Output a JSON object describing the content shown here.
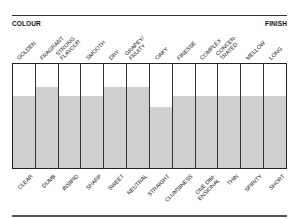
{
  "header": {
    "left_label": "COLOUR",
    "right_label": "FINISH"
  },
  "chart_data": {
    "type": "bar",
    "title": "",
    "xlabel": "",
    "ylabel": "",
    "ylim": [
      0,
      100
    ],
    "grid": false,
    "legend": "none",
    "annotations": [
      "COLOUR",
      "FINISH"
    ],
    "categories_top": [
      "GOLDEN",
      "FRAGRANT",
      "STRONG FLAVOUR",
      "SMOOTH",
      "DRY",
      "GRAPEY/ FRUITY",
      "OAKY",
      "FINESSE",
      "COMPLEX",
      "CONCEN- TRATED",
      "MELLOW",
      "LONG"
    ],
    "categories_bottom": [
      "CLEAR",
      "DUMB",
      "INSIPID",
      "SHARP",
      "SWEET",
      "NEUTRAL",
      "STRAIGHT",
      "CLUMSINESS",
      "ONE DIM- ENSIONAL",
      "THIN",
      "SPIRITY",
      "SHORT"
    ],
    "values": [
      69,
      78,
      69,
      69,
      78,
      78,
      59,
      69,
      69,
      69,
      69,
      69
    ],
    "colors": {
      "fill": "#cfcfcf",
      "border": "#222222",
      "background": "#ffffff"
    }
  },
  "columns": [
    {
      "top": "GOLDEN",
      "bottom": "CLEAR",
      "value": 69
    },
    {
      "top": "FRAGRANT",
      "bottom": "DUMB",
      "value": 78
    },
    {
      "top": "STRONG\nFLAVOUR",
      "bottom": "INSIPID",
      "value": 69
    },
    {
      "top": "SMOOTH",
      "bottom": "SHARP",
      "value": 69
    },
    {
      "top": "DRY",
      "bottom": "SWEET",
      "value": 78
    },
    {
      "top": "GRAPEY/\nFRUITY",
      "bottom": "NEUTRAL",
      "value": 78
    },
    {
      "top": "OAKY",
      "bottom": "STRAIGHT",
      "value": 59
    },
    {
      "top": "FINESSE",
      "bottom": "CLUMSINESS",
      "value": 69
    },
    {
      "top": "COMPLEX",
      "bottom": "ONE DIM-\nENSIONAL",
      "value": 69
    },
    {
      "top": "CONCEN-\nTRATED",
      "bottom": "THIN",
      "value": 69
    },
    {
      "top": "MELLOW",
      "bottom": "SPIRITY",
      "value": 69
    },
    {
      "top": "LONG",
      "bottom": "SHORT",
      "value": 69
    }
  ]
}
